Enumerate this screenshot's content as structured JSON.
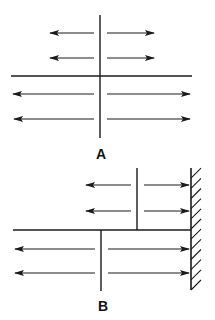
{
  "colors": {
    "stroke": "#1a1a1a",
    "background": "#ffffff"
  },
  "figure_a": {
    "label": "A",
    "label_pos": [
      101,
      159
    ],
    "vertical_line": {
      "x": 100,
      "y1": 15,
      "y2": 138
    },
    "horizontal_line": {
      "y": 76,
      "x1": 11,
      "x2": 192
    },
    "arrows": [
      {
        "dir": "left",
        "y": 33,
        "x_from": 94,
        "x_to": 50
      },
      {
        "dir": "right",
        "y": 33,
        "x_from": 107,
        "x_to": 154
      },
      {
        "dir": "left",
        "y": 58,
        "x_from": 94,
        "x_to": 50
      },
      {
        "dir": "right",
        "y": 58,
        "x_from": 107,
        "x_to": 154
      },
      {
        "dir": "left",
        "y": 94,
        "x_from": 94,
        "x_to": 13
      },
      {
        "dir": "right",
        "y": 94,
        "x_from": 107,
        "x_to": 190
      },
      {
        "dir": "left",
        "y": 119,
        "x_from": 94,
        "x_to": 14
      },
      {
        "dir": "right",
        "y": 119,
        "x_from": 107,
        "x_to": 190
      }
    ]
  },
  "figure_b": {
    "label": "B",
    "label_pos": [
      103,
      311
    ],
    "wall": {
      "x": 191,
      "y1": 168,
      "y2": 290,
      "hatch_count": 12
    },
    "upper_vertical_line": {
      "x": 137,
      "y1": 168,
      "y2": 230
    },
    "lower_vertical_line": {
      "x": 101,
      "y1": 230,
      "y2": 291
    },
    "horizontal_line": {
      "y": 230,
      "x1": 13,
      "x2": 191
    },
    "arrows": [
      {
        "dir": "left",
        "y": 185,
        "x_from": 131,
        "x_to": 86
      },
      {
        "dir": "right",
        "y": 185,
        "x_from": 144,
        "x_to": 189
      },
      {
        "dir": "left",
        "y": 211,
        "x_from": 131,
        "x_to": 86
      },
      {
        "dir": "right",
        "y": 211,
        "x_from": 144,
        "x_to": 189
      },
      {
        "dir": "left",
        "y": 249,
        "x_from": 95,
        "x_to": 15
      },
      {
        "dir": "right",
        "y": 249,
        "x_from": 108,
        "x_to": 189
      },
      {
        "dir": "left",
        "y": 273,
        "x_from": 95,
        "x_to": 15
      },
      {
        "dir": "right",
        "y": 273,
        "x_from": 108,
        "x_to": 189
      }
    ]
  }
}
